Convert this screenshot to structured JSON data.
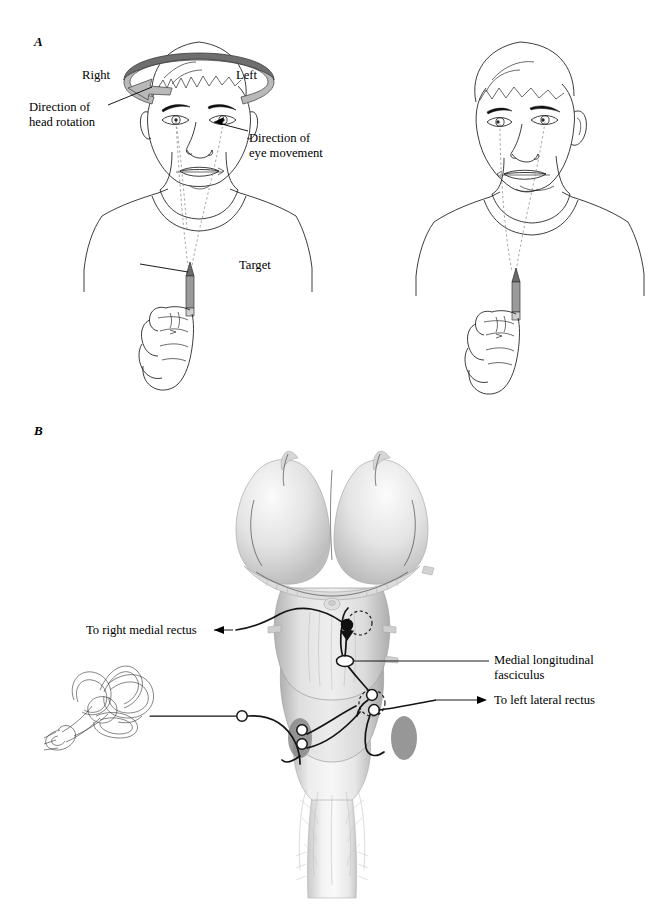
{
  "figure": {
    "background_color": "#ffffff",
    "width": 669,
    "height": 917
  },
  "panels": [
    {
      "letter": "A",
      "name": "behavioral-demonstration",
      "labels": [
        {
          "id": "right",
          "text": "Right"
        },
        {
          "id": "left",
          "text": "Left"
        },
        {
          "id": "head-rotation",
          "text": "Direction of\nhead rotation"
        },
        {
          "id": "eye-movement",
          "text": "Direction of\neye movement"
        },
        {
          "id": "target",
          "text": "Target"
        }
      ]
    },
    {
      "letter": "B",
      "name": "brainstem-circuitry",
      "labels": [
        {
          "id": "right-medial-rectus",
          "text": "To right medial rectus"
        },
        {
          "id": "mlf",
          "text": "Medial longitudinal\nfasciculus"
        },
        {
          "id": "left-lateral-rectus",
          "text": "To left lateral rectus"
        }
      ]
    }
  ],
  "colors": {
    "ink": "#111111",
    "line": "#1a1a1a",
    "dashed_gaze": "#8a8a8a",
    "ring_band": "#b9b9b9",
    "ring_top": "#6e6e6e",
    "brainstem_light": "#e9e9e9",
    "brainstem_shadow": "#b5b5b5",
    "nucleus_dark": "#7d7d7d",
    "pencil_body": "#9a9a9a"
  },
  "panel_a": {
    "letter": "A",
    "left_subject": {
      "name": "head-rotating-subject",
      "ring_label_right": "Right",
      "ring_label_left": "Left",
      "head_rotation_label": "Direction of\nhead rotation",
      "eye_movement_label": "Direction of\neye movement",
      "target_label": "Target"
    },
    "right_subject": {
      "name": "head-rotated-subject"
    }
  },
  "panel_b": {
    "letter": "B",
    "structures": [
      {
        "name": "vestibular-labyrinth"
      },
      {
        "name": "vestibular-ganglion"
      },
      {
        "name": "brainstem"
      },
      {
        "name": "oculomotor-nucleus"
      },
      {
        "name": "abducens-nucleus"
      },
      {
        "name": "vestibular-nucleus"
      }
    ],
    "label_right_medial_rectus": "To right medial rectus",
    "label_mlf": "Medial longitudinal\nfasciculus",
    "label_left_lateral_rectus": "To left lateral rectus"
  }
}
